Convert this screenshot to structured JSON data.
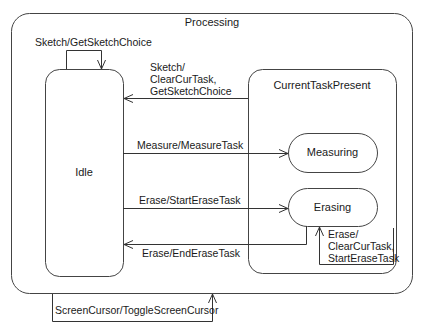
{
  "diagram": {
    "type": "state-machine",
    "composite_state": {
      "name": "Processing"
    },
    "states": [
      {
        "id": "idle",
        "name": "Idle"
      },
      {
        "id": "current_task_present",
        "name": "CurrentTaskPresent"
      },
      {
        "id": "measuring",
        "name": "Measuring"
      },
      {
        "id": "erasing",
        "name": "Erasing"
      }
    ],
    "transitions": [
      {
        "id": "t1",
        "from": "Idle",
        "to": "Idle",
        "label": "Sketch/GetSketchChoice"
      },
      {
        "id": "t2",
        "from": "CurrentTaskPresent",
        "to": "Idle",
        "label_lines": [
          "Sketch/",
          "ClearCurTask,",
          "GetSketchChoice"
        ]
      },
      {
        "id": "t3",
        "from": "Idle",
        "to": "Measuring",
        "label": "Measure/MeasureTask"
      },
      {
        "id": "t4",
        "from": "Idle",
        "to": "Erasing",
        "label": "Erase/StartEraseTask"
      },
      {
        "id": "t5",
        "from": "Erasing",
        "to": "Idle",
        "label": "Erase/EndEraseTask"
      },
      {
        "id": "t6",
        "from": "Erasing",
        "to": "Erasing",
        "label_lines": [
          "Erase/",
          "ClearCurTask,",
          "StartEraseTask"
        ]
      },
      {
        "id": "t7",
        "from": "Processing",
        "to": "Processing",
        "label": "ScreenCursor/ToggleScreenCursor"
      }
    ],
    "colors": {
      "line": "#333333",
      "text": "#1a1a1a",
      "background": "#ffffff"
    }
  }
}
